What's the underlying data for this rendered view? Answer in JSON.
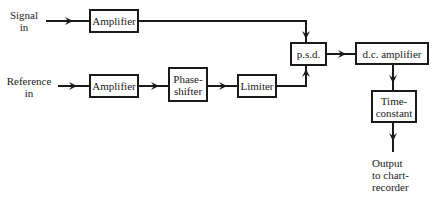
{
  "diagram": {
    "inputs": {
      "signal": {
        "line1": "Signal",
        "line2": "in"
      },
      "reference": {
        "line1": "Reference",
        "line2": "in"
      }
    },
    "blocks": {
      "signal_amplifier": "Amplifier",
      "reference_amplifier": "Amplifier",
      "phase_shifter": {
        "line1": "Phase-",
        "line2": "shifter"
      },
      "limiter": "Limiter",
      "psd": "p.s.d.",
      "dc_amplifier": "d.c. amplifier",
      "time_constant": {
        "line1": "Time-",
        "line2": "constant"
      }
    },
    "output": {
      "line1": "Output",
      "line2": "to chart-",
      "line3": "recorder"
    },
    "colors": {
      "line": "#1a1a1a",
      "background": "#ffffff"
    }
  }
}
